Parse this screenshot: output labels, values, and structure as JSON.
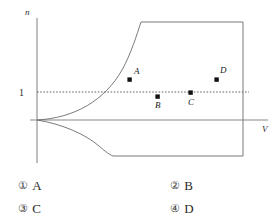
{
  "figure": {
    "y_axis_label": "n",
    "x_axis_label": "V",
    "y_tick_label": "1",
    "reference_line_value": 1,
    "points": [
      {
        "id": "A",
        "label": "A",
        "x": 130,
        "y": 80,
        "label_x": 134,
        "label_y": 74
      },
      {
        "id": "B",
        "label": "B",
        "x": 158,
        "y": 97,
        "label_x": 157,
        "label_y": 108
      },
      {
        "id": "C",
        "label": "C",
        "x": 191,
        "y": 93,
        "label_x": 190,
        "label_y": 105
      },
      {
        "id": "D",
        "label": "D",
        "x": 217,
        "y": 80,
        "label_x": 220,
        "label_y": 73
      }
    ],
    "colors": {
      "curve": "#6b6b6b",
      "axis": "#8a8a8a",
      "dashed": "#3a3a3a",
      "point": "#111111",
      "background": "#ffffff"
    }
  },
  "options": [
    {
      "marker": "①",
      "text": "A"
    },
    {
      "marker": "②",
      "text": "B"
    },
    {
      "marker": "③",
      "text": "C"
    },
    {
      "marker": "④",
      "text": "D"
    }
  ]
}
